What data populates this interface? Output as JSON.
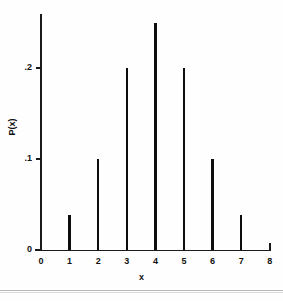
{
  "chart_data": {
    "type": "bar",
    "title": "",
    "xlabel": "x",
    "ylabel": "P(x)",
    "categories": [
      "0",
      "1",
      "2",
      "3",
      "4",
      "5",
      "6",
      "7",
      "8"
    ],
    "x": [
      0,
      1,
      2,
      3,
      4,
      5,
      6,
      7,
      8
    ],
    "values": [
      0,
      0.038,
      0.1,
      0.2,
      0.25,
      0.2,
      0.1,
      0.038,
      0
    ],
    "xlim": [
      0,
      8
    ],
    "ylim": [
      0,
      0.26
    ],
    "x_tick_labels": [
      "0",
      "1",
      "2",
      "3",
      "4",
      "5",
      "6",
      "7",
      "8"
    ],
    "y_tick_labels": [
      "0",
      ".1",
      ".2"
    ],
    "y_tick_values": [
      0,
      0.1,
      0.2
    ],
    "grid": false,
    "legend": null,
    "series": [
      {
        "name": "P(x)",
        "values": [
          0,
          0.038,
          0.1,
          0.2,
          0.25,
          0.2,
          0.1,
          0.038,
          0
        ]
      }
    ],
    "bar_color": "#0d0d0d",
    "axis_color": "#1a1a1a",
    "background_color": "#fefefe"
  }
}
